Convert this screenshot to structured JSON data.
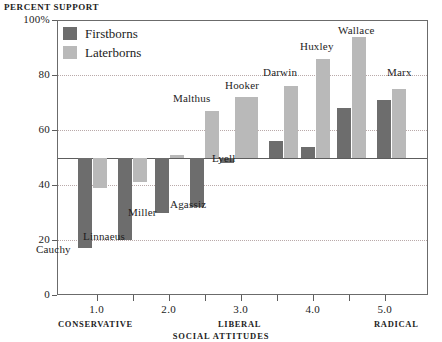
{
  "chart_data": {
    "type": "bar",
    "title": "PERCENT SUPPORT",
    "xlabel": "SOCIAL ATTITUDES",
    "ylabel": "PERCENT SUPPORT",
    "grid": true,
    "legend_position": "top-left",
    "baseline": 50,
    "ylim": [
      0,
      100
    ],
    "xlim": [
      0.45,
      5.6
    ],
    "yticks": [
      0,
      20,
      40,
      60,
      80,
      100
    ],
    "ytick_labels": [
      "0",
      "20",
      "40",
      "60",
      "80",
      "100%"
    ],
    "xticks": [
      1.0,
      1.5,
      2.0,
      2.5,
      3.0,
      3.5,
      4.0,
      4.5,
      5.0
    ],
    "xtick_labels": [
      {
        "value": 1.0,
        "label": "1.0"
      },
      {
        "value": 2.0,
        "label": "2.0"
      },
      {
        "value": 3.0,
        "label": "3.0"
      },
      {
        "value": 4.0,
        "label": "4.0"
      },
      {
        "value": 5.0,
        "label": "5.0"
      }
    ],
    "axis_end_labels": [
      {
        "label": "CONSERVATIVE",
        "position": "left"
      },
      {
        "label": "LIBERAL",
        "position": "center"
      },
      {
        "label": "RADICAL",
        "position": "right"
      }
    ],
    "series": [
      {
        "name": "Firstborns",
        "color": "#6d6d6d"
      },
      {
        "name": "Laterborns",
        "color": "#b9b9b9"
      }
    ],
    "categories": [
      "Cauchy",
      "Linnaeus",
      "Miller",
      "Agassiz",
      "Lyell",
      "Hooker",
      "Darwin",
      "Huxley",
      "Wallace",
      "Marx"
    ],
    "points": [
      {
        "label": "Cauchy",
        "x": 0.95,
        "firstborns": 17,
        "laterborns": 39
      },
      {
        "label": "Linnaeus",
        "x": 1.5,
        "firstborns": 20,
        "laterborns": 41
      },
      {
        "label": "Miller",
        "x": 2.02,
        "firstborns": 30,
        "laterborns": 51
      },
      {
        "label": "Agassiz",
        "x": 2.5,
        "firstborns": 32,
        "laterborns": 67
      },
      {
        "label": "Lyell",
        "x": 2.92,
        "firstborns": 48,
        "laterborns": 72
      },
      {
        "label": "Hooker",
        "x": 3.05,
        "firstborns": null,
        "laterborns": 72
      },
      {
        "label": "Darwin",
        "x": 3.6,
        "firstborns": 56,
        "laterborns": 76
      },
      {
        "label": "Huxley",
        "x": 4.05,
        "firstborns": 54,
        "laterborns": 86
      },
      {
        "label": "Wallace",
        "x": 4.55,
        "firstborns": 68,
        "laterborns": 94
      },
      {
        "label": "Marx",
        "x": 5.1,
        "firstborns": 71,
        "laterborns": 75
      }
    ]
  },
  "legend": {
    "items": [
      {
        "label": "Firstborns",
        "color": "#6d6d6d"
      },
      {
        "label": "Laterborns",
        "color": "#b9b9b9"
      }
    ]
  },
  "bar_labels": [
    {
      "text": "Cauchy",
      "left": 36,
      "top": 243
    },
    {
      "text": "Linnaeus",
      "left": 83,
      "top": 230
    },
    {
      "text": "Miller",
      "left": 128,
      "top": 206
    },
    {
      "text": "Agassiz",
      "left": 170,
      "top": 198
    },
    {
      "text": "Lyell",
      "left": 212,
      "top": 152
    },
    {
      "text": "Malthus",
      "left": 173,
      "top": 92
    },
    {
      "text": "Hooker",
      "left": 225,
      "top": 79
    },
    {
      "text": "Darwin",
      "left": 263,
      "top": 66
    },
    {
      "text": "Huxley",
      "left": 300,
      "top": 40
    },
    {
      "text": "Wallace",
      "left": 338,
      "top": 24
    },
    {
      "text": "Marx",
      "left": 387,
      "top": 66
    }
  ],
  "y_axis": {
    "ticks": [
      {
        "label": "100%",
        "value": 100
      },
      {
        "label": "80",
        "value": 80
      },
      {
        "label": "60",
        "value": 60
      },
      {
        "label": "40",
        "value": 40
      },
      {
        "label": "20",
        "value": 20
      },
      {
        "label": "0",
        "value": 0
      }
    ]
  },
  "x_axis": {
    "title": "SOCIAL ATTITUDES",
    "ticks": [
      "1.0",
      "2.0",
      "3.0",
      "4.0",
      "5.0"
    ],
    "ends": {
      "left": "CONSERVATIVE",
      "center": "LIBERAL",
      "right": "RADICAL"
    }
  }
}
